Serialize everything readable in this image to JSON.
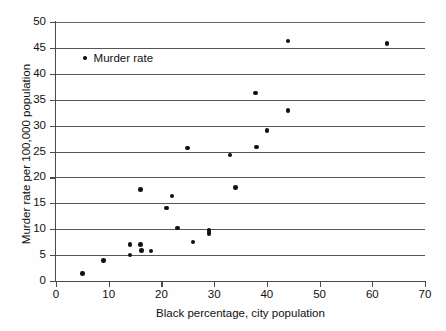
{
  "chart_data": {
    "type": "scatter",
    "title": "",
    "xlabel": "Black percentage, city population",
    "ylabel": "Murder rate per 100,000 population",
    "xlim": [
      0,
      70
    ],
    "ylim": [
      0,
      50
    ],
    "xticks": [
      0,
      10,
      20,
      30,
      40,
      50,
      60,
      70
    ],
    "yticks": [
      0,
      5,
      10,
      15,
      20,
      25,
      30,
      35,
      40,
      45,
      50
    ],
    "grid": "horizontal",
    "legend_position": "upper-left-inside",
    "series": [
      {
        "name": "Murder rate",
        "marker": "diamond",
        "color": "#111111",
        "points": [
          [
            5.0,
            1.5
          ],
          [
            9.0,
            4.0
          ],
          [
            14.0,
            7.1
          ],
          [
            14.0,
            5.0
          ],
          [
            16.0,
            7.1
          ],
          [
            16.2,
            5.9
          ],
          [
            18.0,
            5.8
          ],
          [
            16.0,
            17.7
          ],
          [
            21.0,
            14.1
          ],
          [
            22.0,
            16.4
          ],
          [
            23.0,
            10.2
          ],
          [
            25.0,
            25.7
          ],
          [
            26.0,
            7.5
          ],
          [
            29.0,
            9.8
          ],
          [
            29.0,
            9.2
          ],
          [
            33.0,
            24.3
          ],
          [
            34.0,
            18.1
          ],
          [
            37.8,
            36.3
          ],
          [
            38.0,
            25.9
          ],
          [
            40.0,
            29.1
          ],
          [
            44.0,
            32.9
          ],
          [
            44.0,
            46.3
          ],
          [
            62.8,
            45.9
          ]
        ]
      }
    ]
  },
  "legend": {
    "series_label": "Murder rate"
  },
  "axes": {
    "x_title": "Black percentage, city population",
    "y_title": "Murder rate per 100,000 population",
    "x_tick_labels": [
      "0",
      "10",
      "20",
      "30",
      "40",
      "50",
      "60",
      "70"
    ],
    "y_tick_labels": [
      "0",
      "5",
      "10",
      "15",
      "20",
      "25",
      "30",
      "35",
      "40",
      "45",
      "50"
    ]
  },
  "colors": {
    "marker": "#111111",
    "gridline": "#555555",
    "axis": "#4a4a4a",
    "background": "#ffffff"
  }
}
